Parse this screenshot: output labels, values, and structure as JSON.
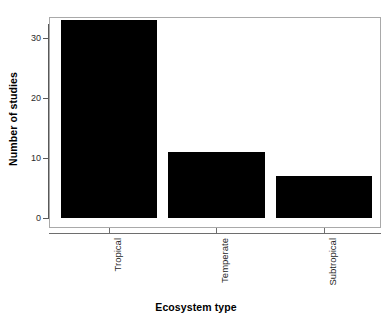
{
  "chart_data": {
    "type": "bar",
    "title": "",
    "subtitle": "",
    "categories": [
      "Tropical",
      "Temperate",
      "Subtropical"
    ],
    "values": [
      33,
      11,
      7
    ],
    "xlabel": "Ecosystem type",
    "ylabel": "Number of studies",
    "ylim": [
      0,
      33
    ],
    "yticks": [
      0,
      10,
      20,
      30
    ],
    "ytick_labels": [
      "0",
      "10",
      "20",
      "30"
    ],
    "grid": false,
    "legend": false,
    "legend_position": "none",
    "bar_color": "#000000",
    "background_color": "#ffffff",
    "frame_color": "#a9a9a9",
    "axis_color": "#595959",
    "xtick_label_rotation": 90,
    "series": [
      {
        "name": "Number of studies",
        "values": [
          33,
          11,
          7
        ]
      }
    ],
    "bars": [
      {
        "category": "Tropical",
        "value": 33,
        "value_label": "33"
      },
      {
        "category": "Temperate",
        "value": 11,
        "value_label": "11"
      },
      {
        "category": "Subtropical",
        "value": 7,
        "value_label": "7"
      }
    ]
  }
}
